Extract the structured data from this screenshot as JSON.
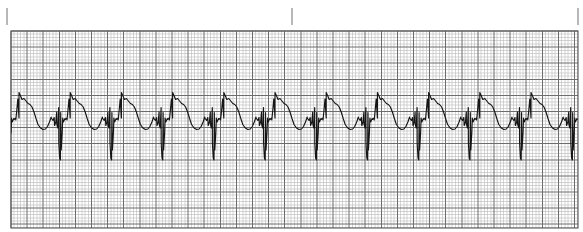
{
  "document": {
    "title": "ECG Rhythm Strip",
    "description": "Single-lead electrocardiogram rhythm strip printed on standard pink/grey ECG graph paper",
    "background_color": "#ffffff"
  },
  "ruler": {
    "name": "top-tick-ruler",
    "tick_color": "#9a9a9a",
    "ticks": [
      {
        "label": "",
        "x": 7,
        "y_top": 8,
        "y_bottom": 25
      },
      {
        "label": "",
        "x": 292,
        "y_top": 8,
        "y_bottom": 25
      },
      {
        "label": "",
        "x": 578,
        "y_top": 8,
        "y_bottom": 25
      }
    ]
  },
  "grid": {
    "name": "ecg-graph-paper",
    "x": 11,
    "y": 31,
    "width": 567,
    "height": 197,
    "fine_step": 3.22,
    "bold_every": 5,
    "fine_color": "#b9b9b9",
    "bold_color": "#6d6d6d",
    "frame_color": "#5a5a5a"
  },
  "chart_data": {
    "type": "line",
    "title": "",
    "xlabel": "",
    "ylabel": "",
    "subtitle": "",
    "grid": true,
    "legend_position": "none",
    "trace_color": "#151515",
    "paper_speed_mm_per_s": 25,
    "gain_mm_per_mV": 10,
    "small_box_px": 3.22,
    "large_box_px": 16.1,
    "baseline_y_px": 118,
    "rr_interval_px": 51.2,
    "beat_count": 12,
    "first_beat_r_px": 19,
    "rhythm": "regular narrow-complex tachycardia",
    "axis_note": "x axis = time, y axis = voltage",
    "xlim": [
      11,
      578
    ],
    "ylim": [
      31,
      228
    ],
    "beat_template": {
      "description": "One cardiac cycle expressed as offsets from the R-wave peak x position, in pixels; y values are absolute pixel rows (smaller y = higher voltage)",
      "points": [
        {
          "dx": -19.0,
          "y": 118.0,
          "feature": "baseline"
        },
        {
          "dx": -16.0,
          "y": 117.5,
          "feature": "baseline"
        },
        {
          "dx": -13.5,
          "y": 112.0,
          "feature": "p-wave-upstroke"
        },
        {
          "dx": -11.5,
          "y": 107.5,
          "feature": "p-wave-peak"
        },
        {
          "dx": -9.5,
          "y": 112.5,
          "feature": "p-wave-downstroke"
        },
        {
          "dx": -7.5,
          "y": 118.0,
          "feature": "pr-segment"
        },
        {
          "dx": -5.0,
          "y": 119.5,
          "feature": "pr-segment"
        },
        {
          "dx": -3.2,
          "y": 120.0,
          "feature": "q-wave"
        },
        {
          "dx": -2.2,
          "y": 110.0,
          "feature": "r-upstroke"
        },
        {
          "dx": -1.2,
          "y": 99.0,
          "feature": "r-upstroke"
        },
        {
          "dx": 0.0,
          "y": 92.5,
          "feature": "r-peak"
        },
        {
          "dx": 1.6,
          "y": 96.0,
          "feature": "r-downstroke"
        },
        {
          "dx": 3.0,
          "y": 99.5,
          "feature": "notch-shoulder"
        },
        {
          "dx": 5.0,
          "y": 98.5,
          "feature": "notch-shoulder"
        },
        {
          "dx": 7.0,
          "y": 101.0,
          "feature": "st-takeoff"
        },
        {
          "dx": 9.0,
          "y": 103.5,
          "feature": "st-segment"
        },
        {
          "dx": 11.0,
          "y": 104.5,
          "feature": "st-segment"
        },
        {
          "dx": 13.0,
          "y": 107.0,
          "feature": "t-wave-descent"
        },
        {
          "dx": 15.0,
          "y": 112.0,
          "feature": "t-wave-descent"
        },
        {
          "dx": 17.0,
          "y": 118.5,
          "feature": "t-wave-descent"
        },
        {
          "dx": 19.0,
          "y": 124.5,
          "feature": "t-wave-trough"
        },
        {
          "dx": 21.5,
          "y": 128.0,
          "feature": "t-wave-trough"
        },
        {
          "dx": 24.0,
          "y": 129.5,
          "feature": "t-wave-trough"
        },
        {
          "dx": 26.5,
          "y": 129.0,
          "feature": "t-wave-recovery"
        },
        {
          "dx": 28.5,
          "y": 126.5,
          "feature": "t-wave-recovery"
        },
        {
          "dx": 30.5,
          "y": 122.0,
          "feature": "late-bump-upstroke"
        },
        {
          "dx": 32.2,
          "y": 117.0,
          "feature": "late-bump-peak"
        },
        {
          "dx": 34.0,
          "y": 120.5,
          "feature": "late-bump-downstroke"
        },
        {
          "dx": 35.6,
          "y": 125.5,
          "feature": "pre-qrs-dip"
        },
        {
          "dx": 36.8,
          "y": 122.0,
          "feature": "pre-qrs-dip"
        },
        {
          "dx": 37.8,
          "y": 124.0,
          "feature": "pre-qrs-dip"
        },
        {
          "dx": 38.8,
          "y": 128.0,
          "feature": "s-downstroke"
        },
        {
          "dx": 39.8,
          "y": 143.0,
          "feature": "s-downstroke"
        },
        {
          "dx": 40.6,
          "y": 158.0,
          "feature": "s-wave-nadir"
        },
        {
          "dx": 41.4,
          "y": 160.0,
          "feature": "s-wave-nadir"
        },
        {
          "dx": 42.2,
          "y": 150.0,
          "feature": "s-upstroke"
        },
        {
          "dx": 43.2,
          "y": 133.0,
          "feature": "s-upstroke"
        },
        {
          "dx": 44.4,
          "y": 122.0,
          "feature": "j-point"
        },
        {
          "dx": 46.0,
          "y": 118.5,
          "feature": "baseline-return"
        },
        {
          "dx": 48.0,
          "y": 118.0,
          "feature": "baseline"
        },
        {
          "dx": 51.2,
          "y": 118.0,
          "feature": "baseline"
        }
      ]
    }
  }
}
